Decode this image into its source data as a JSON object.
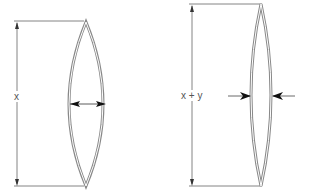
{
  "diagram": {
    "colors": {
      "line": "#666666",
      "lens_outer": "#888888",
      "lens_inner": "#ffffff",
      "arrow": "#222222",
      "label": "#555555"
    },
    "figures": [
      {
        "id": "left",
        "dimension_label": "x",
        "lens_style": "wide",
        "thickness_arrows": "outward"
      },
      {
        "id": "right",
        "dimension_label": "x + y",
        "lens_style": "narrow",
        "thickness_arrows": "inward"
      }
    ]
  }
}
